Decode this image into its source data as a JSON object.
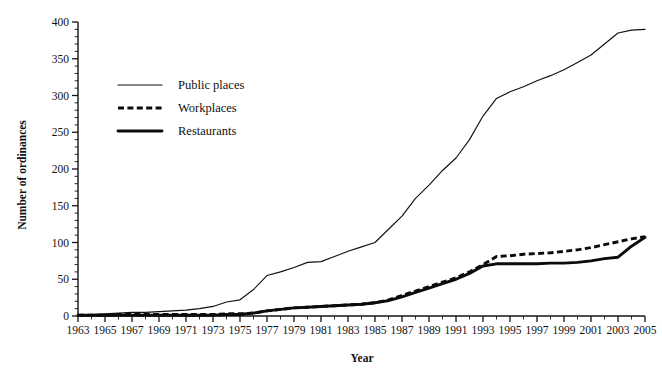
{
  "chart_data": {
    "type": "line",
    "title": "",
    "xlabel": "Year",
    "ylabel": "Number of ordinances",
    "xlim": [
      1963,
      2005
    ],
    "ylim": [
      0,
      400
    ],
    "y_major_ticks": [
      0,
      50,
      100,
      150,
      200,
      250,
      300,
      350,
      400
    ],
    "y_minor_step": 10,
    "x_tick_labels": [
      "1963",
      "1965",
      "1967",
      "1969",
      "1971",
      "1973",
      "1975",
      "1977",
      "1979",
      "1981",
      "1983",
      "1985",
      "1987",
      "1989",
      "1991",
      "1993",
      "1995",
      "1997",
      "1999",
      "2001",
      "2003",
      "2005"
    ],
    "x_minor_step": 1,
    "grid": false,
    "legend_position": "upper-left-inside",
    "x": [
      1963,
      1964,
      1965,
      1966,
      1967,
      1968,
      1969,
      1970,
      1971,
      1972,
      1973,
      1974,
      1975,
      1976,
      1977,
      1978,
      1979,
      1980,
      1981,
      1982,
      1983,
      1984,
      1985,
      1986,
      1987,
      1988,
      1989,
      1990,
      1991,
      1992,
      1993,
      1994,
      1995,
      1996,
      1997,
      1998,
      1999,
      2000,
      2001,
      2002,
      2003,
      2004,
      2005
    ],
    "series": [
      {
        "name": "Public places",
        "style": "thin-solid",
        "color": "#111111",
        "values": [
          1,
          2,
          3,
          4,
          5,
          5,
          6,
          7,
          8,
          10,
          13,
          19,
          22,
          36,
          55,
          60,
          66,
          73,
          74,
          81,
          88,
          94,
          100,
          118,
          136,
          160,
          178,
          198,
          215,
          240,
          272,
          296,
          305,
          312,
          320,
          327,
          335,
          345,
          355,
          370,
          385,
          389,
          390
        ]
      },
      {
        "name": "Workplaces",
        "style": "thick-dashed",
        "color": "#0b0b0b",
        "values": [
          1,
          1,
          1,
          2,
          2,
          2,
          2,
          2,
          2,
          2,
          2,
          3,
          3,
          4,
          7,
          9,
          11,
          12,
          13,
          14,
          15,
          16,
          18,
          22,
          28,
          34,
          40,
          46,
          52,
          60,
          70,
          81,
          82,
          84,
          85,
          86,
          88,
          90,
          93,
          97,
          101,
          105,
          108
        ]
      },
      {
        "name": "Restaurants",
        "style": "thick-solid",
        "color": "#0b0b0b",
        "values": [
          1,
          1,
          1,
          1,
          1,
          1,
          1,
          1,
          1,
          1,
          1,
          2,
          2,
          4,
          7,
          9,
          11,
          12,
          13,
          14,
          15,
          16,
          18,
          21,
          26,
          32,
          38,
          44,
          50,
          58,
          68,
          71,
          71,
          71,
          71,
          72,
          72,
          73,
          75,
          78,
          80,
          95,
          107
        ]
      }
    ]
  },
  "legend": {
    "items": [
      {
        "label": "Public places",
        "style": "thin-solid"
      },
      {
        "label": "Workplaces",
        "style": "thick-dashed"
      },
      {
        "label": "Restaurants",
        "style": "thick-solid"
      }
    ]
  },
  "axes": {
    "y_title": "Number of ordinances",
    "x_title": "Year"
  }
}
